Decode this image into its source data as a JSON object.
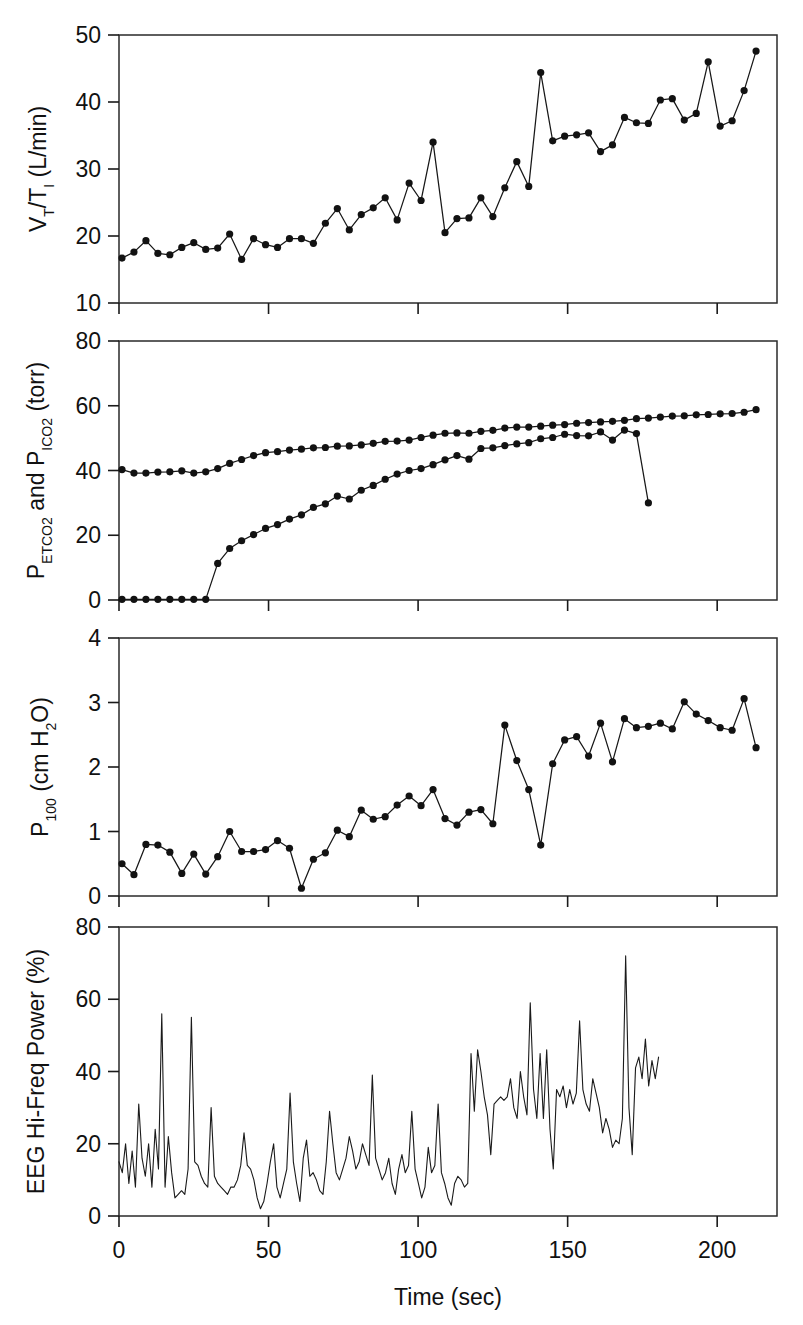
{
  "figure": {
    "caption": "",
    "xaxis": {
      "label": "Time (sec)",
      "unit": "sec",
      "ticks": [
        0,
        50,
        100,
        150,
        200
      ],
      "tick_labels": [
        "0",
        "50",
        "100",
        "150",
        "200"
      ],
      "range": [
        0,
        220
      ]
    }
  },
  "chart_data": [
    {
      "type": "line",
      "panel": 1,
      "title": "",
      "ylabel": "V_T/T_I (L/min)",
      "ylabel_parts": {
        "pre": "V",
        "sub1": "T",
        "mid": "/T",
        "sub2": "I",
        "post": " (L/min)"
      },
      "xlabel": "Time (sec)",
      "ylim": [
        10,
        50
      ],
      "xlim": [
        0,
        220
      ],
      "yticks": [
        10,
        20,
        30,
        40,
        50
      ],
      "ytick_labels": [
        "10",
        "20",
        "30",
        "40",
        "50"
      ],
      "grid": false,
      "markers": true,
      "legend": "none",
      "series": [
        {
          "name": "VT/TI",
          "x": [
            1,
            5,
            9,
            13,
            17,
            21,
            25,
            29,
            33,
            37,
            41,
            45,
            49,
            53,
            57,
            61,
            65,
            69,
            73,
            77,
            81,
            85,
            89,
            93,
            97,
            101,
            105,
            109,
            113,
            117,
            121,
            125,
            129,
            133,
            137,
            141,
            145,
            149,
            153,
            157,
            161,
            165,
            169,
            173,
            177,
            181,
            185,
            189,
            193,
            197,
            201,
            205,
            209
          ],
          "values": [
            16.7,
            17.6,
            19.3,
            17.4,
            17.2,
            18.3,
            19.0,
            18.0,
            18.2,
            20.3,
            16.5,
            19.6,
            18.7,
            18.3,
            19.6,
            19.6,
            18.9,
            21.9,
            24.1,
            20.9,
            23.2,
            24.2,
            25.7,
            22.4,
            27.9,
            25.3,
            34.0,
            20.5,
            22.6,
            22.7,
            25.7,
            22.9,
            27.2,
            31.1,
            27.4,
            44.4,
            34.2,
            34.9,
            35.1,
            35.4,
            32.6,
            33.6,
            37.7,
            36.9,
            36.8,
            40.3,
            40.5,
            37.3,
            38.3,
            46.0,
            36.4,
            37.2,
            41.7
          ],
          "marker_shape": "circle"
        },
        {
          "name": "VT/TI tail",
          "x": [
            213
          ],
          "values": [
            47.6
          ],
          "marker_shape": "circle",
          "connect_from_previous": true
        }
      ]
    },
    {
      "type": "line",
      "panel": 2,
      "title": "",
      "ylabel": "P_ETCO2 and P_ICO2 (torr)",
      "ylabel_parts": {
        "p1": "P",
        "sub1": "ETCO2",
        "mid": " and P",
        "sub2": "ICO2",
        "post": " (torr)"
      },
      "xlabel": "Time (sec)",
      "ylim": [
        0,
        80
      ],
      "xlim": [
        0,
        220
      ],
      "yticks": [
        0,
        20,
        40,
        60,
        80
      ],
      "ytick_labels": [
        "0",
        "20",
        "40",
        "60",
        "80"
      ],
      "grid": false,
      "markers": true,
      "legend": "none",
      "series": [
        {
          "name": "PETCO2",
          "x": [
            1,
            5,
            9,
            13,
            17,
            21,
            25,
            29,
            33,
            37,
            41,
            45,
            49,
            53,
            57,
            61,
            65,
            69,
            73,
            77,
            81,
            85,
            89,
            93,
            97,
            101,
            105,
            109,
            113,
            117,
            121,
            125,
            129,
            133,
            137,
            141,
            145,
            149,
            153,
            157,
            161,
            165,
            169,
            173,
            177,
            181,
            185,
            189,
            193,
            197,
            201,
            205,
            209,
            213
          ],
          "values": [
            40.3,
            39.2,
            39.2,
            39.5,
            39.6,
            39.9,
            39.2,
            39.6,
            40.6,
            42.2,
            43.4,
            44.6,
            45.5,
            45.8,
            46.3,
            46.6,
            47.0,
            47.1,
            47.5,
            47.6,
            47.9,
            48.4,
            49.0,
            49.1,
            49.4,
            50.2,
            50.9,
            51.5,
            51.6,
            51.5,
            52.1,
            52.4,
            53.1,
            53.4,
            53.4,
            53.7,
            54.0,
            54.2,
            54.6,
            54.8,
            55.0,
            55.2,
            55.5,
            56.0,
            56.2,
            56.5,
            56.8,
            56.9,
            57.2,
            57.3,
            57.5,
            57.6,
            58.0,
            58.8
          ],
          "marker_shape": "circle"
        },
        {
          "name": "PICO2",
          "x": [
            1,
            5,
            9,
            13,
            17,
            21,
            25,
            29,
            33,
            37,
            41,
            45,
            49,
            53,
            57,
            61,
            65,
            69,
            73,
            77,
            81,
            85,
            89,
            93,
            97,
            101,
            105,
            109,
            113,
            117,
            121,
            125,
            129,
            133,
            137,
            141,
            145,
            149,
            153,
            157,
            161,
            165,
            169,
            173,
            177,
            181,
            185,
            189,
            193,
            197,
            201,
            205,
            209,
            213
          ],
          "values": [
            0.2,
            0.2,
            0.2,
            0.2,
            0.2,
            0.2,
            0.2,
            0.2,
            11.3,
            15.9,
            18.3,
            20.2,
            22.1,
            23.3,
            25.0,
            26.3,
            28.6,
            29.7,
            32.1,
            31.2,
            33.9,
            35.4,
            37.3,
            38.9,
            40.0,
            40.6,
            41.8,
            43.3,
            44.6,
            43.5,
            46.8,
            47.0,
            47.7,
            48.2,
            48.6,
            49.8,
            50.2,
            51.2,
            50.8,
            50.7,
            51.9,
            49.4,
            52.5,
            51.4,
            30.0
          ],
          "marker_shape": "circle"
        }
      ]
    },
    {
      "type": "line",
      "panel": 3,
      "title": "",
      "ylabel": "P_100 (cm H_2O)",
      "ylabel_parts": {
        "p1": "P",
        "sub1": "100",
        "mid": " (cm H",
        "sub2": "2",
        "post": "O)"
      },
      "xlabel": "Time (sec)",
      "ylim": [
        0,
        4
      ],
      "xlim": [
        0,
        220
      ],
      "yticks": [
        0,
        1,
        2,
        3,
        4
      ],
      "ytick_labels": [
        "0",
        "1",
        "2",
        "3",
        "4"
      ],
      "grid": false,
      "markers": true,
      "legend": "none",
      "series": [
        {
          "name": "P100",
          "x": [
            1,
            5,
            9,
            13,
            17,
            21,
            25,
            29,
            33,
            37,
            41,
            45,
            49,
            53,
            57,
            61,
            65,
            69,
            73,
            77,
            81,
            85,
            89,
            93,
            97,
            101,
            105,
            109,
            113,
            117,
            121,
            125,
            129,
            133,
            137,
            141,
            145,
            149,
            153,
            157,
            161,
            165,
            169,
            173,
            177,
            181,
            185,
            189,
            193,
            197,
            201,
            205,
            209
          ],
          "values": [
            0.5,
            0.33,
            0.8,
            0.79,
            0.68,
            0.35,
            0.65,
            0.34,
            0.61,
            1.0,
            0.69,
            0.69,
            0.72,
            0.86,
            0.74,
            0.12,
            0.57,
            0.67,
            1.02,
            0.92,
            1.33,
            1.19,
            1.23,
            1.41,
            1.55,
            1.4,
            1.65,
            1.2,
            1.1,
            1.3,
            1.34,
            1.12,
            2.65,
            2.1,
            1.65,
            0.79,
            2.05,
            2.42,
            2.47,
            2.17,
            2.68,
            2.08,
            2.75,
            2.61,
            2.63,
            2.68,
            2.59,
            3.01,
            2.82,
            2.72,
            2.61,
            2.57,
            3.06
          ],
          "marker_shape": "circle"
        },
        {
          "name": "P100 tail",
          "x": [
            213
          ],
          "values": [
            2.3
          ],
          "marker_shape": "circle",
          "connect_from_previous": true
        }
      ]
    },
    {
      "type": "line",
      "panel": 4,
      "title": "",
      "ylabel": "EEG Hi-Freq Power (%)",
      "xlabel": "Time (sec)",
      "ylim": [
        0,
        80
      ],
      "xlim": [
        0,
        220
      ],
      "yticks": [
        0,
        20,
        40,
        60,
        80
      ],
      "ytick_labels": [
        "0",
        "20",
        "40",
        "60",
        "80"
      ],
      "grid": false,
      "markers": false,
      "legend": "none",
      "series": [
        {
          "name": "EEG Hi-Freq Power",
          "xstart": 0,
          "xstep": 1.1,
          "values": [
            15,
            12,
            20,
            9,
            18,
            8,
            31,
            16,
            11,
            20,
            8,
            24,
            13,
            56,
            8,
            22,
            12,
            5,
            6,
            7,
            6,
            13,
            55,
            15,
            14,
            11,
            9,
            8,
            30,
            11,
            9,
            8,
            7,
            6,
            8,
            8,
            10,
            14,
            23,
            14,
            13,
            10,
            5,
            2,
            4,
            9,
            15,
            20,
            8,
            5,
            9,
            13,
            34,
            15,
            9,
            4,
            16,
            21,
            11,
            12,
            10,
            7,
            6,
            15,
            29,
            20,
            12,
            10,
            13,
            16,
            22,
            18,
            13,
            15,
            20,
            17,
            14,
            39,
            16,
            13,
            10,
            12,
            16,
            9,
            6,
            13,
            17,
            12,
            14,
            29,
            13,
            9,
            5,
            8,
            19,
            12,
            14,
            31,
            12,
            9,
            5,
            3,
            9,
            11,
            10,
            8,
            9,
            45,
            29,
            46,
            40,
            33,
            28,
            17,
            31,
            32,
            33,
            32,
            33,
            38,
            30,
            27,
            40,
            33,
            28,
            59,
            35,
            27,
            45,
            27,
            46,
            24,
            13,
            35,
            33,
            36,
            30,
            35,
            31,
            34,
            54,
            35,
            31,
            29,
            38,
            34,
            30,
            23,
            27,
            24,
            19,
            21,
            20,
            27,
            72,
            30,
            17,
            41,
            44,
            38,
            49,
            36,
            43,
            38,
            44
          ]
        }
      ]
    }
  ]
}
